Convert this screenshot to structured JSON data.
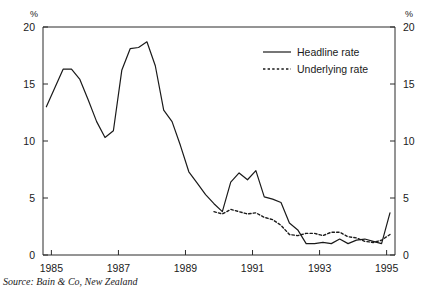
{
  "figure": {
    "unit_label_left": "%",
    "unit_label_right": "%",
    "source_note": "Source: Bain & Co, New Zealand"
  },
  "legend": {
    "position": "top-right-inside",
    "entries": [
      {
        "label": "Headline rate",
        "style": "solid"
      },
      {
        "label": "Underlying rate",
        "style": "dotted"
      }
    ]
  },
  "chart_data": {
    "type": "line",
    "title": "",
    "subtitle": "",
    "xlabel": "",
    "ylabel": "%",
    "xlim": [
      1984.75,
      1995.25
    ],
    "ylim": [
      0,
      20
    ],
    "yticks": [
      0,
      5,
      10,
      15,
      20
    ],
    "ytick_labels": [
      "0",
      "5",
      "10",
      "15",
      "20"
    ],
    "xticks": [
      1985,
      1987,
      1989,
      1991,
      1993,
      1995
    ],
    "xtick_labels": [
      "1985",
      "1987",
      "1989",
      "1991",
      "1993",
      "1995"
    ],
    "grid": false,
    "legend_position": "upper right",
    "annotations": [
      "Source: Bain & Co, New Zealand"
    ],
    "series": [
      {
        "name": "Headline rate",
        "style": "solid",
        "x": [
          1984.85,
          1985.35,
          1985.6,
          1985.85,
          1986.1,
          1986.35,
          1986.6,
          1986.85,
          1987.1,
          1987.35,
          1987.6,
          1987.85,
          1988.1,
          1988.35,
          1988.6,
          1988.85,
          1989.1,
          1989.35,
          1989.6,
          1989.85,
          1990.1,
          1990.35,
          1990.6,
          1990.85,
          1991.1,
          1991.35,
          1991.6,
          1991.85,
          1992.1,
          1992.35,
          1992.6,
          1992.85,
          1993.1,
          1993.35,
          1993.6,
          1993.85,
          1994.1,
          1994.35,
          1994.6,
          1994.85,
          1995.1
        ],
        "values": [
          13.0,
          16.3,
          16.3,
          15.4,
          13.6,
          11.7,
          10.3,
          10.9,
          16.2,
          18.1,
          18.2,
          18.7,
          16.6,
          12.7,
          11.7,
          9.6,
          7.3,
          6.3,
          5.3,
          4.5,
          3.8,
          6.4,
          7.2,
          6.6,
          7.4,
          5.1,
          4.9,
          4.6,
          2.8,
          2.2,
          1.0,
          1.0,
          1.1,
          1.0,
          1.4,
          1.0,
          1.3,
          1.4,
          1.2,
          1.0,
          3.7
        ]
      },
      {
        "name": "Underlying rate",
        "style": "dotted",
        "x": [
          1989.85,
          1990.1,
          1990.35,
          1990.6,
          1990.85,
          1991.1,
          1991.35,
          1991.6,
          1991.85,
          1992.1,
          1992.35,
          1992.6,
          1992.85,
          1993.1,
          1993.35,
          1993.6,
          1993.85,
          1994.1,
          1994.35,
          1994.6,
          1994.85,
          1995.1
        ],
        "values": [
          3.8,
          3.6,
          4.0,
          3.8,
          3.6,
          3.7,
          3.3,
          3.1,
          2.6,
          1.8,
          1.7,
          1.9,
          1.9,
          1.7,
          2.0,
          2.0,
          1.6,
          1.5,
          1.2,
          1.1,
          1.3,
          1.8
        ]
      }
    ]
  }
}
